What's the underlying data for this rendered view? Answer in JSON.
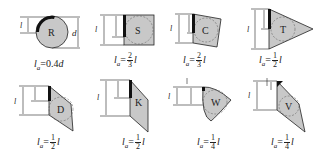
{
  "inserts": [
    {
      "id": "R",
      "shape": "round",
      "formula_prefix": "l",
      "formula_sub": "a",
      "formula_eq": "=0.4",
      "formula_var": "d",
      "dim_labels": [
        "la",
        "d"
      ]
    },
    {
      "id": "S",
      "shape": "square",
      "formula_prefix": "l",
      "formula_sub": "a",
      "formula_eq": "=",
      "num": "2",
      "den": "3",
      "formula_var": "l",
      "dim_labels": [
        "l",
        "la"
      ]
    },
    {
      "id": "C",
      "shape": "rhombic-80",
      "formula_prefix": "l",
      "formula_sub": "a",
      "formula_eq": "=",
      "num": "2",
      "den": "3",
      "formula_var": "l",
      "dim_labels": [
        "l",
        "la"
      ]
    },
    {
      "id": "T",
      "shape": "triangle",
      "formula_prefix": "l",
      "formula_sub": "a",
      "formula_eq": "=",
      "num": "1",
      "den": "2",
      "formula_var": "l",
      "dim_labels": [
        "l",
        "la"
      ]
    },
    {
      "id": "D",
      "shape": "rhombic-55",
      "formula_prefix": "l",
      "formula_sub": "a",
      "formula_eq": "=",
      "num": "1",
      "den": "2",
      "formula_var": "l",
      "dim_labels": [
        "l",
        "la"
      ]
    },
    {
      "id": "K",
      "shape": "parallelogram",
      "formula_prefix": "l",
      "formula_sub": "a",
      "formula_eq": "=",
      "num": "1",
      "den": "2",
      "formula_var": "l",
      "dim_labels": [
        "l",
        "la"
      ]
    },
    {
      "id": "W",
      "shape": "trigon",
      "formula_prefix": "l",
      "formula_sub": "a",
      "formula_eq": "=",
      "num": "1",
      "den": "4",
      "formula_var": "l",
      "dim_labels": [
        "l",
        "la"
      ]
    },
    {
      "id": "V",
      "shape": "rhombic-35",
      "formula_prefix": "l",
      "formula_sub": "a",
      "formula_eq": "=",
      "num": "1",
      "den": "4",
      "formula_var": "l",
      "dim_labels": [
        "l",
        "la"
      ]
    }
  ],
  "colors": {
    "fill": "#c8c8c8",
    "stroke": "#222222",
    "edge": "#111111"
  }
}
